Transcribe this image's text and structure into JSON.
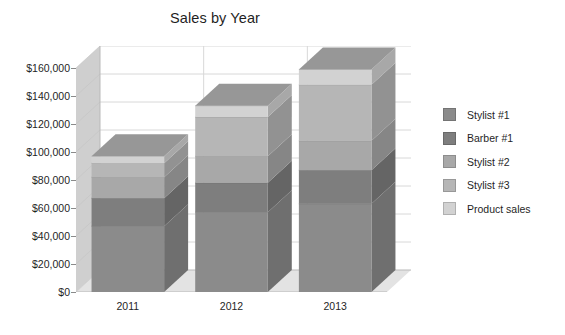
{
  "chart_data": {
    "type": "bar",
    "subtype": "stacked-column-3d",
    "title": "Sales by Year",
    "xlabel": "",
    "ylabel": "",
    "categories": [
      "2011",
      "2012",
      "2013"
    ],
    "ylim": [
      0,
      160000
    ],
    "ytick_values": [
      0,
      20000,
      40000,
      60000,
      80000,
      100000,
      120000,
      140000,
      160000
    ],
    "ytick_labels": [
      "$0",
      "$20,000",
      "$40,000",
      "$60,000",
      "$80,000",
      "$100,000",
      "$120,000",
      "$140,000",
      "$160,000"
    ],
    "grid": true,
    "legend_position": "right",
    "series": [
      {
        "name": "Stylist #1",
        "color": "#8b8b8b",
        "values": [
          47000,
          57000,
          63000
        ]
      },
      {
        "name": "Barber #1",
        "color": "#7e7e7e",
        "values": [
          20000,
          21000,
          24000
        ]
      },
      {
        "name": "Stylist #2",
        "color": "#a8a8a8",
        "values": [
          15000,
          19000,
          21000
        ]
      },
      {
        "name": "Stylist #3",
        "color": "#b6b6b6",
        "values": [
          10000,
          28000,
          40000
        ]
      },
      {
        "name": "Product sales",
        "color": "#d2d2d2",
        "values": [
          5000,
          8000,
          11000
        ]
      }
    ],
    "totals": [
      97000,
      133000,
      159000
    ]
  },
  "legend": {
    "items": [
      {
        "label": "Stylist #1"
      },
      {
        "label": "Barber #1"
      },
      {
        "label": "Stylist #2"
      },
      {
        "label": "Stylist #3"
      },
      {
        "label": "Product sales"
      }
    ]
  }
}
